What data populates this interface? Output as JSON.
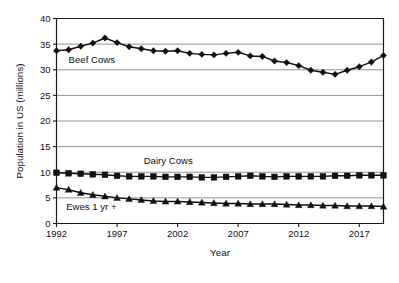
{
  "chart_data": {
    "type": "line",
    "title": "",
    "xlabel": "Year",
    "ylabel": "Population in US (millions)",
    "xlim": [
      1992,
      2019
    ],
    "ylim": [
      0,
      40
    ],
    "grid": "horizontal",
    "legend_position": "inline-plot-labels",
    "x": [
      1992,
      1993,
      1994,
      1995,
      1996,
      1997,
      1998,
      1999,
      2000,
      2001,
      2002,
      2003,
      2004,
      2005,
      2006,
      2007,
      2008,
      2009,
      2010,
      2011,
      2012,
      2013,
      2014,
      2015,
      2016,
      2017,
      2018,
      2019
    ],
    "xticks": [
      1992,
      1997,
      2002,
      2007,
      2012,
      2017
    ],
    "xtick_labels": [
      "1992",
      "1997",
      "2002",
      "2007",
      "2012",
      "2017"
    ],
    "yticks": [
      0,
      5,
      10,
      15,
      20,
      25,
      30,
      35,
      40
    ],
    "ytick_labels": [
      "0",
      "5",
      "10",
      "15",
      "20",
      "25",
      "30",
      "35",
      "40"
    ],
    "series": [
      {
        "name": "Beef Cows",
        "marker": "diamond",
        "color": "#111111",
        "label_x": 1993.0,
        "label_y": 31.4,
        "values": [
          33.7,
          33.9,
          34.6,
          35.2,
          36.2,
          35.3,
          34.5,
          34.1,
          33.7,
          33.6,
          33.7,
          33.2,
          33.0,
          32.9,
          33.2,
          33.4,
          32.7,
          32.6,
          31.7,
          31.4,
          30.8,
          29.9,
          29.5,
          29.1,
          29.9,
          30.6,
          31.5,
          32.8
        ]
      },
      {
        "name": "Dairy Cows",
        "marker": "square",
        "color": "#111111",
        "label_x": 1999.2,
        "label_y": 11.6,
        "values": [
          9.9,
          9.8,
          9.7,
          9.6,
          9.5,
          9.3,
          9.2,
          9.2,
          9.2,
          9.1,
          9.1,
          9.1,
          9.0,
          9.0,
          9.1,
          9.2,
          9.3,
          9.2,
          9.1,
          9.2,
          9.2,
          9.2,
          9.2,
          9.3,
          9.3,
          9.4,
          9.4,
          9.4
        ]
      },
      {
        "name": "Ewes 1 yr +",
        "marker": "triangle",
        "color": "#111111",
        "label_x": 1992.8,
        "label_y": 2.6,
        "values": [
          7.0,
          6.6,
          6.0,
          5.6,
          5.3,
          5.0,
          4.8,
          4.6,
          4.4,
          4.3,
          4.3,
          4.2,
          4.1,
          4.0,
          3.9,
          3.9,
          3.8,
          3.8,
          3.8,
          3.7,
          3.6,
          3.6,
          3.5,
          3.5,
          3.4,
          3.4,
          3.4,
          3.3
        ]
      }
    ]
  }
}
